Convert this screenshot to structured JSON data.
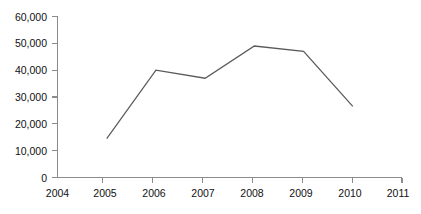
{
  "chart_data": {
    "type": "line",
    "title": "",
    "subtitle": "",
    "xlabel": "",
    "ylabel": "",
    "x": [
      2005,
      2006,
      2007,
      2008,
      2009,
      2010
    ],
    "categories": [
      "2005",
      "2006",
      "2007",
      "2008",
      "2009",
      "2010"
    ],
    "values": [
      14500,
      40000,
      37000,
      49000,
      47000,
      26500
    ],
    "series": [
      {
        "name": "",
        "values": [
          14500,
          40000,
          37000,
          49000,
          47000,
          26500
        ]
      }
    ],
    "xlim": [
      2004,
      2011
    ],
    "ylim": [
      0,
      60000
    ],
    "x_ticks": [
      2004,
      2005,
      2006,
      2007,
      2008,
      2009,
      2010,
      2011
    ],
    "x_tick_labels": [
      "2004",
      "2005",
      "2006",
      "2007",
      "2008",
      "2009",
      "2010",
      "2011"
    ],
    "y_ticks": [
      0,
      10000,
      20000,
      30000,
      40000,
      50000,
      60000
    ],
    "y_tick_labels": [
      "0",
      "10,000",
      "20,000",
      "30,000",
      "40,000",
      "50,000",
      "60,000"
    ],
    "grid": false,
    "legend": false,
    "legend_position": "none",
    "annotations": [],
    "colors": {
      "background": "#ffffff",
      "line": "#5a5a5a",
      "axis": "#8c8c8c",
      "text": "#111111"
    }
  },
  "axes": {
    "y_labels": {
      "t0": "0",
      "t1": "10,000",
      "t2": "20,000",
      "t3": "30,000",
      "t4": "40,000",
      "t5": "50,000",
      "t6": "60,000"
    },
    "x_labels": {
      "t0": "2004",
      "t1": "2005",
      "t2": "2006",
      "t3": "2007",
      "t4": "2008",
      "t5": "2009",
      "t6": "2010",
      "t7": "2011"
    }
  }
}
